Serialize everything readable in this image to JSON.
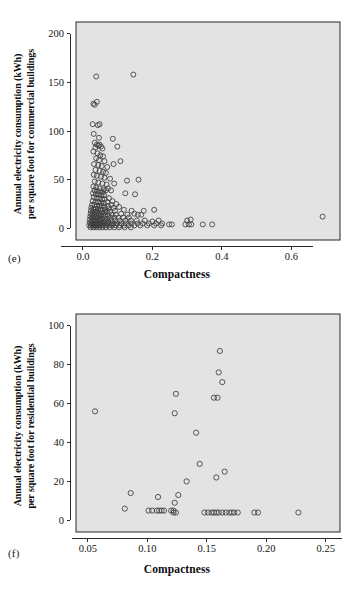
{
  "figure": {
    "background_color": "#ffffff",
    "plot_background_color": "#e3e3e3",
    "marker_color": "#3c3c3c"
  },
  "panels": {
    "e": {
      "label": "(e)",
      "xtitle": "Compactness",
      "ytitle_line1": "Annual electricity consumption (kWh)",
      "ytitle_line2": "per square foot for commercial buildings"
    },
    "f": {
      "label": "(f)",
      "xtitle": "Compactness",
      "ytitle_line1": "Annual electricity consumption (kWh)",
      "ytitle_line2": "per square foot for residential buildings"
    }
  },
  "chart_data": [
    {
      "id": "e",
      "type": "scatter",
      "title": "",
      "panel_label": "(e)",
      "xlabel": "Compactness",
      "ylabel": "Annual electricity consumption (kWh) per square foot for commercial buildings",
      "xlim": [
        -0.02,
        0.74
      ],
      "ylim": [
        -12,
        212
      ],
      "xticks": [
        0.0,
        0.2,
        0.4,
        0.6
      ],
      "xticklabels": [
        "0.0",
        "0.2",
        "0.4",
        "0.6"
      ],
      "yticks": [
        0,
        50,
        100,
        150,
        200
      ],
      "yticklabels": [
        "0",
        "50",
        "100",
        "150",
        "200"
      ],
      "grid": false,
      "legend": "none",
      "marker": "open-circle",
      "points": [
        [
          0.038,
          156
        ],
        [
          0.145,
          158
        ],
        [
          0.03,
          128
        ],
        [
          0.034,
          127
        ],
        [
          0.04,
          130
        ],
        [
          0.028,
          107
        ],
        [
          0.043,
          106
        ],
        [
          0.048,
          107
        ],
        [
          0.031,
          97
        ],
        [
          0.046,
          93
        ],
        [
          0.086,
          92
        ],
        [
          0.034,
          88
        ],
        [
          0.04,
          86
        ],
        [
          0.044,
          85
        ],
        [
          0.048,
          86
        ],
        [
          0.052,
          84
        ],
        [
          0.036,
          83
        ],
        [
          0.056,
          82
        ],
        [
          0.099,
          84
        ],
        [
          0.03,
          79
        ],
        [
          0.042,
          77
        ],
        [
          0.05,
          75
        ],
        [
          0.058,
          74
        ],
        [
          0.038,
          72
        ],
        [
          0.046,
          70
        ],
        [
          0.062,
          69
        ],
        [
          0.108,
          69
        ],
        [
          0.032,
          66
        ],
        [
          0.044,
          65
        ],
        [
          0.054,
          64
        ],
        [
          0.07,
          63
        ],
        [
          0.088,
          66
        ],
        [
          0.036,
          60
        ],
        [
          0.048,
          59
        ],
        [
          0.058,
          58
        ],
        [
          0.066,
          57
        ],
        [
          0.031,
          55
        ],
        [
          0.04,
          54
        ],
        [
          0.052,
          53
        ],
        [
          0.062,
          52
        ],
        [
          0.078,
          51
        ],
        [
          0.127,
          49
        ],
        [
          0.16,
          50
        ],
        [
          0.034,
          48
        ],
        [
          0.044,
          47
        ],
        [
          0.056,
          46
        ],
        [
          0.068,
          45
        ],
        [
          0.09,
          46
        ],
        [
          0.03,
          43
        ],
        [
          0.038,
          42
        ],
        [
          0.048,
          41
        ],
        [
          0.06,
          40
        ],
        [
          0.072,
          41
        ],
        [
          0.033,
          39
        ],
        [
          0.041,
          38
        ],
        [
          0.05,
          38
        ],
        [
          0.058,
          37
        ],
        [
          0.066,
          39
        ],
        [
          0.081,
          39
        ],
        [
          0.029,
          36
        ],
        [
          0.037,
          35
        ],
        [
          0.045,
          35
        ],
        [
          0.053,
          34
        ],
        [
          0.061,
          34
        ],
        [
          0.122,
          36
        ],
        [
          0.15,
          35
        ],
        [
          0.031,
          32
        ],
        [
          0.039,
          31
        ],
        [
          0.047,
          31
        ],
        [
          0.055,
          30
        ],
        [
          0.063,
          30
        ],
        [
          0.075,
          31
        ],
        [
          0.028,
          28
        ],
        [
          0.036,
          27
        ],
        [
          0.044,
          27
        ],
        [
          0.052,
          26
        ],
        [
          0.06,
          26
        ],
        [
          0.07,
          27
        ],
        [
          0.085,
          28
        ],
        [
          0.026,
          24
        ],
        [
          0.033,
          24
        ],
        [
          0.04,
          23
        ],
        [
          0.047,
          23
        ],
        [
          0.054,
          23
        ],
        [
          0.062,
          22
        ],
        [
          0.072,
          23
        ],
        [
          0.082,
          24
        ],
        [
          0.096,
          25
        ],
        [
          0.024,
          21
        ],
        [
          0.03,
          20
        ],
        [
          0.036,
          20
        ],
        [
          0.043,
          20
        ],
        [
          0.05,
          19
        ],
        [
          0.057,
          19
        ],
        [
          0.065,
          19
        ],
        [
          0.074,
          20
        ],
        [
          0.088,
          21
        ],
        [
          0.104,
          22
        ],
        [
          0.023,
          18
        ],
        [
          0.029,
          17
        ],
        [
          0.035,
          17
        ],
        [
          0.041,
          17
        ],
        [
          0.047,
          16
        ],
        [
          0.054,
          16
        ],
        [
          0.061,
          16
        ],
        [
          0.069,
          17
        ],
        [
          0.078,
          17
        ],
        [
          0.092,
          18
        ],
        [
          0.118,
          19
        ],
        [
          0.14,
          18
        ],
        [
          0.175,
          18
        ],
        [
          0.205,
          19
        ],
        [
          0.022,
          15
        ],
        [
          0.027,
          14
        ],
        [
          0.033,
          14
        ],
        [
          0.039,
          14
        ],
        [
          0.045,
          14
        ],
        [
          0.051,
          13
        ],
        [
          0.058,
          13
        ],
        [
          0.065,
          13
        ],
        [
          0.073,
          13
        ],
        [
          0.083,
          14
        ],
        [
          0.095,
          14
        ],
        [
          0.11,
          15
        ],
        [
          0.128,
          14
        ],
        [
          0.148,
          15
        ],
        [
          0.158,
          14
        ],
        [
          0.168,
          14
        ],
        [
          0.69,
          12
        ],
        [
          0.021,
          12
        ],
        [
          0.026,
          11
        ],
        [
          0.031,
          11
        ],
        [
          0.037,
          11
        ],
        [
          0.043,
          11
        ],
        [
          0.049,
          10
        ],
        [
          0.055,
          10
        ],
        [
          0.062,
          10
        ],
        [
          0.07,
          10
        ],
        [
          0.079,
          11
        ],
        [
          0.09,
          11
        ],
        [
          0.102,
          11
        ],
        [
          0.116,
          11
        ],
        [
          0.132,
          11
        ],
        [
          0.02,
          9
        ],
        [
          0.025,
          8
        ],
        [
          0.03,
          8
        ],
        [
          0.035,
          8
        ],
        [
          0.04,
          8
        ],
        [
          0.046,
          8
        ],
        [
          0.052,
          8
        ],
        [
          0.058,
          7
        ],
        [
          0.065,
          7
        ],
        [
          0.073,
          7
        ],
        [
          0.082,
          8
        ],
        [
          0.093,
          8
        ],
        [
          0.106,
          8
        ],
        [
          0.122,
          8
        ],
        [
          0.138,
          8
        ],
        [
          0.155,
          8
        ],
        [
          0.178,
          8
        ],
        [
          0.2,
          7
        ],
        [
          0.218,
          8
        ],
        [
          0.3,
          8
        ],
        [
          0.31,
          9
        ],
        [
          0.019,
          6
        ],
        [
          0.024,
          5
        ],
        [
          0.029,
          5
        ],
        [
          0.034,
          5
        ],
        [
          0.039,
          5
        ],
        [
          0.044,
          5
        ],
        [
          0.05,
          5
        ],
        [
          0.056,
          5
        ],
        [
          0.063,
          5
        ],
        [
          0.07,
          5
        ],
        [
          0.078,
          5
        ],
        [
          0.087,
          5
        ],
        [
          0.098,
          5
        ],
        [
          0.11,
          5
        ],
        [
          0.124,
          5
        ],
        [
          0.14,
          5
        ],
        [
          0.157,
          5
        ],
        [
          0.172,
          5
        ],
        [
          0.19,
          5
        ],
        [
          0.21,
          5
        ],
        [
          0.228,
          5
        ],
        [
          0.248,
          4
        ],
        [
          0.256,
          4
        ],
        [
          0.295,
          4
        ],
        [
          0.305,
          4
        ],
        [
          0.312,
          4
        ],
        [
          0.345,
          4
        ],
        [
          0.372,
          4
        ],
        [
          0.018,
          3
        ],
        [
          0.023,
          3
        ],
        [
          0.028,
          3
        ],
        [
          0.033,
          3
        ],
        [
          0.038,
          3
        ],
        [
          0.043,
          3
        ],
        [
          0.048,
          3
        ],
        [
          0.054,
          3
        ],
        [
          0.06,
          3
        ],
        [
          0.067,
          3
        ],
        [
          0.075,
          3
        ],
        [
          0.084,
          3
        ],
        [
          0.094,
          3
        ],
        [
          0.105,
          3
        ],
        [
          0.118,
          3
        ],
        [
          0.132,
          3
        ],
        [
          0.148,
          3
        ],
        [
          0.165,
          3
        ],
        [
          0.185,
          3
        ],
        [
          0.205,
          3
        ],
        [
          0.225,
          3
        ],
        [
          0.022,
          1
        ],
        [
          0.03,
          1
        ],
        [
          0.038,
          1
        ],
        [
          0.047,
          1
        ],
        [
          0.056,
          1
        ],
        [
          0.066,
          1
        ],
        [
          0.077,
          1
        ],
        [
          0.09,
          1
        ],
        [
          0.104,
          1
        ],
        [
          0.12,
          1
        ],
        [
          0.138,
          1
        ]
      ]
    },
    {
      "id": "f",
      "type": "scatter",
      "title": "",
      "panel_label": "(f)",
      "xlabel": "Compactness",
      "ylabel": "Annual electricity consumption (kWh) per square foot for residential buildings",
      "xlim": [
        0.04,
        0.262
      ],
      "ylim": [
        -6,
        106
      ],
      "xticks": [
        0.05,
        0.1,
        0.15,
        0.2,
        0.25
      ],
      "xticklabels": [
        "0.05",
        "0.10",
        "0.15",
        "0.20",
        "0.25"
      ],
      "yticks": [
        0,
        20,
        40,
        60,
        80,
        100
      ],
      "yticklabels": [
        "0",
        "20",
        "40",
        "60",
        "80",
        "100"
      ],
      "grid": false,
      "legend": "none",
      "marker": "open-circle",
      "points": [
        [
          0.161,
          87
        ],
        [
          0.16,
          76
        ],
        [
          0.163,
          71
        ],
        [
          0.124,
          65
        ],
        [
          0.156,
          63
        ],
        [
          0.159,
          63
        ],
        [
          0.056,
          56
        ],
        [
          0.123,
          55
        ],
        [
          0.141,
          45
        ],
        [
          0.144,
          29
        ],
        [
          0.165,
          25
        ],
        [
          0.158,
          22
        ],
        [
          0.133,
          20
        ],
        [
          0.086,
          14
        ],
        [
          0.126,
          13
        ],
        [
          0.109,
          12
        ],
        [
          0.123,
          9
        ],
        [
          0.081,
          6
        ],
        [
          0.101,
          5
        ],
        [
          0.104,
          5
        ],
        [
          0.108,
          5
        ],
        [
          0.11,
          5
        ],
        [
          0.112,
          5
        ],
        [
          0.114,
          5
        ],
        [
          0.12,
          5
        ],
        [
          0.122,
          5
        ],
        [
          0.122,
          4
        ],
        [
          0.124,
          4
        ],
        [
          0.148,
          4
        ],
        [
          0.151,
          4
        ],
        [
          0.154,
          4
        ],
        [
          0.156,
          4
        ],
        [
          0.158,
          4
        ],
        [
          0.16,
          4
        ],
        [
          0.163,
          4
        ],
        [
          0.166,
          4
        ],
        [
          0.169,
          4
        ],
        [
          0.171,
          4
        ],
        [
          0.173,
          4
        ],
        [
          0.176,
          4
        ],
        [
          0.19,
          4
        ],
        [
          0.193,
          4
        ],
        [
          0.227,
          4
        ]
      ]
    }
  ]
}
